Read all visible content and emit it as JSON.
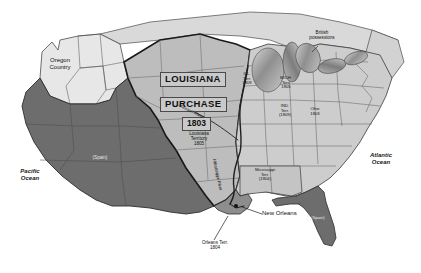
{
  "map": {
    "title": "Louisiana Purchase Map 1803",
    "colors": {
      "ocean": "#ffffff",
      "purchase_fill": "#b8b8b8",
      "spanish_fill": "#6e6e6e",
      "us_states_fill": "#cfcfcf",
      "oregon_fill": "#e3e3e3",
      "british_fill": "#d8d8d8",
      "lake_fill": "#9a9a9a",
      "border_stroke": "#3a3a3a",
      "heavy_border": "#1c1c1c"
    },
    "labels": {
      "oregon_country": "Oregon\nCountry",
      "oregon_country_line1": "Oregon",
      "oregon_country_line2": "Country",
      "louisiana": "LOUISIANA",
      "purchase": "PURCHASE",
      "year_1803": "1803",
      "louisiana_territory_line1": "Louisiana",
      "louisiana_territory_line2": "Territory",
      "louisiana_territory_line3": "1805",
      "spain_west": "(Spain)",
      "spain_florida": "(Spain)",
      "british_line1": "British",
      "british_line2": "possessions",
      "ill_terr_line1": "ILL.",
      "ill_terr_line2": "Terr.",
      "ill_terr_line3": "1809",
      "mich_terr_line1": "MICH.",
      "mich_terr_line2": "Terr.",
      "mich_terr_line3": "1805",
      "ind_terr_line1": "IND.",
      "ind_terr_line2": "Terr.",
      "ind_terr_line3": "(1809)",
      "ohio_line1": "Ohio",
      "ohio_line2": "1803",
      "mississippi_terr_line1": "Mississippi",
      "mississippi_terr_line2": "Terr.",
      "mississippi_terr_line3": "(1804)",
      "orleans_terr_line1": "Orleans Terr.",
      "orleans_terr_line2": "1804",
      "new_orleans": "New Orleans",
      "mississippi_river": "Mississippi River",
      "missouri_river": "Missouri River",
      "pacific_line1": "Pacific",
      "pacific_line2": "Ocean",
      "atlantic_line1": "Atlantic",
      "atlantic_line2": "Ocean"
    }
  }
}
